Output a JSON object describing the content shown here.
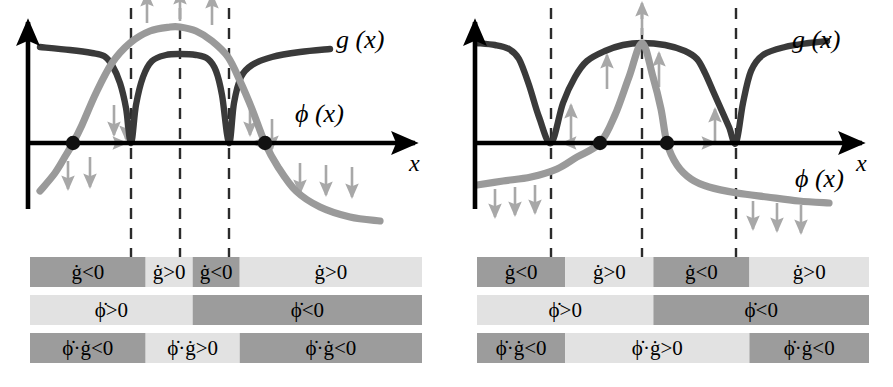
{
  "figure": {
    "type": "phase-diagram-pair",
    "background": "#ffffff",
    "colors": {
      "curve_g": "#3a3a3a",
      "curve_phi": "#9a9a9a",
      "axis": "#000000",
      "arrow_gray": "#a8a8a8",
      "dashed_line": "#2b2b2b",
      "bar_dark": "#9c9c9c",
      "bar_light": "#e2e2e2",
      "dot": "#111111",
      "text": "#000000"
    }
  },
  "labels": {
    "g": "g (x)",
    "phi": "ϕ (x)",
    "x_axis": "x"
  },
  "panels": [
    {
      "id": "left",
      "name": "panel-left",
      "axis": {
        "x_label": "x",
        "origin_x": 28,
        "axis_y": 143,
        "x_end": 415,
        "y_top": 22
      },
      "curve_labels": {
        "g": {
          "text": "g (x)",
          "x": 336,
          "y": 48
        },
        "phi": {
          "text": "ϕ (x)",
          "x": 295,
          "y": 122
        }
      },
      "dashed_lines": [
        131,
        180,
        229
      ],
      "fixed_points": [
        {
          "x": 73,
          "y": 143,
          "type": "zero-crossing"
        },
        {
          "x": 265,
          "y": 143,
          "type": "zero-crossing"
        }
      ],
      "bars": [
        {
          "row": "g-dot",
          "name": "bar-row-gdot",
          "segments": [
            {
              "label": "ġ<0",
              "tone": "dark",
              "width_pct": 29.5
            },
            {
              "label": "ġ>0",
              "tone": "light",
              "width_pct": 12.0
            },
            {
              "label": "ġ<0",
              "tone": "dark",
              "width_pct": 12.0
            },
            {
              "label": "ġ>0",
              "tone": "light",
              "width_pct": 46.5
            }
          ]
        },
        {
          "row": "phi-dot",
          "name": "bar-row-phidot",
          "segments": [
            {
              "label": "ϕ̇>0",
              "tone": "light",
              "width_pct": 41.5
            },
            {
              "label": "ϕ̇<0",
              "tone": "dark",
              "width_pct": 58.5
            }
          ]
        },
        {
          "row": "product",
          "name": "bar-row-product",
          "segments": [
            {
              "label": "ϕ̇·ġ<0",
              "tone": "dark",
              "width_pct": 29.5
            },
            {
              "label": "ϕ̇·ġ>0",
              "tone": "light",
              "width_pct": 24.0
            },
            {
              "label": "ϕ̇·ġ<0",
              "tone": "dark",
              "width_pct": 46.5
            }
          ]
        }
      ]
    },
    {
      "id": "right",
      "name": "panel-right",
      "axis": {
        "x_label": "x",
        "origin_x": 28,
        "axis_y": 143,
        "x_end": 415,
        "y_top": 22
      },
      "curve_labels": {
        "g": {
          "text": "g (x)",
          "x": 345,
          "y": 48
        },
        "phi": {
          "text": "ϕ (x)",
          "x": 348,
          "y": 187
        }
      },
      "dashed_lines": [
        104,
        195,
        289
      ],
      "fixed_points": [
        {
          "x": 153,
          "y": 143,
          "type": "zero-crossing"
        },
        {
          "x": 220,
          "y": 143,
          "type": "zero-crossing"
        }
      ],
      "bars": [
        {
          "row": "g-dot",
          "name": "bar-row-gdot",
          "segments": [
            {
              "label": "ġ<0",
              "tone": "dark",
              "width_pct": 22.5
            },
            {
              "label": "ġ>0",
              "tone": "light",
              "width_pct": 22.5
            },
            {
              "label": "ġ<0",
              "tone": "dark",
              "width_pct": 24.5
            },
            {
              "label": "ġ>0",
              "tone": "light",
              "width_pct": 30.5
            }
          ]
        },
        {
          "row": "phi-dot",
          "name": "bar-row-phidot",
          "segments": [
            {
              "label": "ϕ̇>0",
              "tone": "light",
              "width_pct": 45.0
            },
            {
              "label": "ϕ̇<0",
              "tone": "dark",
              "width_pct": 55.0
            }
          ]
        },
        {
          "row": "product",
          "name": "bar-row-product",
          "segments": [
            {
              "label": "ϕ̇·ġ<0",
              "tone": "dark",
              "width_pct": 22.5
            },
            {
              "label": "ϕ̇·ġ>0",
              "tone": "light",
              "width_pct": 47.0
            },
            {
              "label": "ϕ̇·ġ<0",
              "tone": "dark",
              "width_pct": 30.5
            }
          ]
        }
      ]
    }
  ],
  "chart_data": {
    "type": "line",
    "title": "",
    "xlabel": "x",
    "ylabel": "",
    "grid": false,
    "legend": [
      "g (x)",
      "ϕ (x)"
    ],
    "panels": [
      {
        "panel": "left",
        "series": [
          {
            "name": "g (x)",
            "color": "#3a3a3a",
            "description": "Positive everywhere except two downward spikes touching zero at the first and third dashed lines; high plateau between them.",
            "points": [
              [
                40,
                96
              ],
              [
                70,
                93
              ],
              [
                92,
                90
              ],
              [
                104,
                87
              ],
              [
                112,
                78
              ],
              [
                120,
                60
              ],
              [
                126,
                35
              ],
              [
                131,
                0
              ],
              [
                136,
                38
              ],
              [
                143,
                66
              ],
              [
                152,
                82
              ],
              [
                166,
                88
              ],
              [
                180,
                89
              ],
              [
                196,
                88
              ],
              [
                208,
                84
              ],
              [
                216,
                72
              ],
              [
                222,
                48
              ],
              [
                229,
                0
              ],
              [
                234,
                40
              ],
              [
                241,
                66
              ],
              [
                252,
                78
              ],
              [
                272,
                86
              ],
              [
                300,
                91
              ],
              [
                330,
                94
              ]
            ]
          },
          {
            "name": "ϕ (x)",
            "color": "#9a9a9a",
            "description": "Monotone decreasing smooth S curve crossing zero twice (near x=73 rising from below, and near x=265 falling); bump peaks above g between dashed lines.",
            "points": [
              [
                40,
                -48
              ],
              [
                55,
                -30
              ],
              [
                66,
                -12
              ],
              [
                73,
                0
              ],
              [
                82,
                18
              ],
              [
                96,
                50
              ],
              [
                112,
                80
              ],
              [
                130,
                100
              ],
              [
                150,
                112
              ],
              [
                170,
                116
              ],
              [
                180,
                116
              ],
              [
                196,
                112
              ],
              [
                212,
                102
              ],
              [
                228,
                86
              ],
              [
                240,
                62
              ],
              [
                252,
                34
              ],
              [
                265,
                0
              ],
              [
                278,
                -24
              ],
              [
                296,
                -48
              ],
              [
                320,
                -64
              ],
              [
                350,
                -74
              ],
              [
                380,
                -78
              ]
            ]
          }
        ],
        "arrows": {
          "up": [
            {
              "x": 147,
              "y_from": 120,
              "y_to": 150
            },
            {
              "x": 180,
              "y_from": 122,
              "y_to": 152
            },
            {
              "x": 212,
              "y_from": 118,
              "y_to": 148
            }
          ],
          "down": [
            {
              "x": 68,
              "y_from": -18,
              "y_to": -46
            },
            {
              "x": 90,
              "y_from": -14,
              "y_to": -44
            },
            {
              "x": 114,
              "y_from": 38,
              "y_to": 8
            },
            {
              "x": 126,
              "y_from": 26,
              "y_to": 4
            },
            {
              "x": 250,
              "y_from": 38,
              "y_to": 8
            },
            {
              "x": 272,
              "y_from": 24,
              "y_to": -6
            },
            {
              "x": 300,
              "y_from": -20,
              "y_to": -50
            },
            {
              "x": 326,
              "y_from": -22,
              "y_to": -52
            },
            {
              "x": 352,
              "y_from": -24,
              "y_to": -54
            }
          ],
          "horizontal": [
            {
              "y": 0,
              "x_from": 84,
              "x_to": 126,
              "dir": "right"
            },
            {
              "y": 0,
              "x_from": 292,
              "x_to": 252,
              "dir": "left"
            }
          ]
        }
      },
      {
        "panel": "right",
        "series": [
          {
            "name": "g (x)",
            "color": "#3a3a3a",
            "description": "High plateau with two deep narrow wells touching zero at the first and third dashed lines; broad middle plateau.",
            "points": [
              [
                30,
                100
              ],
              [
                48,
                98
              ],
              [
                62,
                94
              ],
              [
                72,
                84
              ],
              [
                82,
                58
              ],
              [
                92,
                26
              ],
              [
                104,
                0
              ],
              [
                116,
                40
              ],
              [
                128,
                66
              ],
              [
                140,
                82
              ],
              [
                158,
                92
              ],
              [
                176,
                98
              ],
              [
                195,
                100
              ],
              [
                218,
                98
              ],
              [
                238,
                92
              ],
              [
                250,
                84
              ],
              [
                258,
                70
              ],
              [
                266,
                52
              ],
              [
                274,
                34
              ],
              [
                282,
                16
              ],
              [
                289,
                0
              ],
              [
                296,
                40
              ],
              [
                304,
                72
              ],
              [
                316,
                88
              ],
              [
                338,
                96
              ],
              [
                362,
                100
              ],
              [
                380,
                102
              ]
            ]
          },
          {
            "name": "ϕ (x)",
            "color": "#9a9a9a",
            "description": "Low shallow decreasing background with a tall triangular spike peaking at the middle dashed line; crosses zero at two interior fixed points.",
            "points": [
              [
                30,
                -42
              ],
              [
                56,
                -38
              ],
              [
                84,
                -34
              ],
              [
                110,
                -26
              ],
              [
                130,
                -14
              ],
              [
                153,
                0
              ],
              [
                168,
                28
              ],
              [
                182,
                66
              ],
              [
                195,
                100
              ],
              [
                206,
                66
              ],
              [
                214,
                34
              ],
              [
                220,
                0
              ],
              [
                230,
                -22
              ],
              [
                244,
                -36
              ],
              [
                262,
                -44
              ],
              [
                290,
                -50
              ],
              [
                320,
                -54
              ],
              [
                352,
                -58
              ],
              [
                382,
                -60
              ]
            ]
          }
        ],
        "arrows": {
          "up": [
            {
              "x": 124,
              "y_from": 4,
              "y_to": 38
            },
            {
              "x": 160,
              "y_from": 54,
              "y_to": 88
            },
            {
              "x": 195,
              "y_from": 108,
              "y_to": 140
            },
            {
              "x": 212,
              "y_from": 56,
              "y_to": 90
            },
            {
              "x": 268,
              "y_from": 2,
              "y_to": 34
            }
          ],
          "down": [
            {
              "x": 48,
              "y_from": -46,
              "y_to": -74
            },
            {
              "x": 68,
              "y_from": -44,
              "y_to": -72
            },
            {
              "x": 88,
              "y_from": -42,
              "y_to": -70
            },
            {
              "x": 306,
              "y_from": -58,
              "y_to": -86
            },
            {
              "x": 330,
              "y_from": -60,
              "y_to": -88
            },
            {
              "x": 354,
              "y_from": -62,
              "y_to": -90
            }
          ],
          "horizontal": [
            {
              "y": 0,
              "x_from": 148,
              "x_to": 116,
              "dir": "left"
            },
            {
              "y": 0,
              "x_from": 226,
              "x_to": 268,
              "dir": "right"
            }
          ]
        }
      }
    ]
  }
}
